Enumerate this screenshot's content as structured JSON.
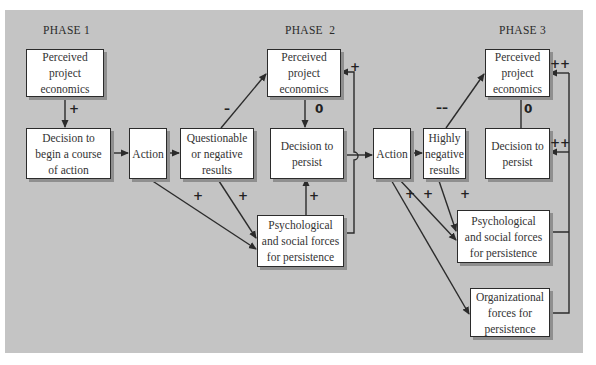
{
  "phases": [
    "PHASE 1",
    "PHASE  2",
    "PHASE 3"
  ],
  "boxes": {
    "p1_perceived": "Perceived project economics",
    "p1_decision": "Decision to begin a course of action",
    "p1_action": "Action",
    "p2_questionable": "Questionable or negative results",
    "p2_perceived": "Perceived project economics",
    "p2_decision": "Decision to persist",
    "p2_psych": "Psychological and social forces for persistence",
    "p2_action": "Action",
    "p3_highly_negative": "Highly negative results",
    "p3_perceived": "Perceived project economics",
    "p3_decision": "Decision to persist",
    "p3_psych": "Psychological and social forces for persistence",
    "p3_org": "Organizational forces for persistence"
  },
  "box_lines": {
    "p1_perceived": [
      "Perceived",
      "project",
      "economics"
    ],
    "p1_decision": [
      "Decision to",
      "begin a course",
      "of action"
    ],
    "p1_action": [
      "Action"
    ],
    "p2_questionable": [
      "Questionable",
      "or negative",
      "results"
    ],
    "p2_perceived": [
      "Perceived",
      "project",
      "economics"
    ],
    "p2_decision": [
      "Decision to",
      "persist"
    ],
    "p2_psych": [
      "Psychological",
      "and social forces",
      "for persistence"
    ],
    "p2_action": [
      "Action"
    ],
    "p3_highly_negative": [
      "Highly",
      "negative",
      "results"
    ],
    "p3_perceived": [
      "Perceived",
      "project",
      "economics"
    ],
    "p3_decision": [
      "Decision to",
      "persist"
    ],
    "p3_psych": [
      "Psychological",
      "and social forces",
      "for persistence"
    ],
    "p3_org": [
      "Organizational",
      "forces for",
      "persistence"
    ]
  },
  "signs": {
    "p1_perceived_to_decision": "+",
    "questionable_to_perceived": "–",
    "p2_perceived_to_decision": "0",
    "psych_feedback_to_perceived": "+",
    "action1_to_psych": "+",
    "questionable_to_psych": "+",
    "psych_to_decision": "+",
    "highly_negative_to_perceived": "––",
    "p3_perceived_decision": "0",
    "forces_to_p3_perceived": "++",
    "forces_to_p3_decision": "++",
    "action2_to_org": "+",
    "action2_to_psych": "+",
    "highly_negative_to_psych": "+"
  },
  "colors": {
    "panel": "#c4c4c4",
    "box_fill": "#ffffff",
    "line": "#2b2b2b",
    "shadow": "#8f8f8f"
  }
}
